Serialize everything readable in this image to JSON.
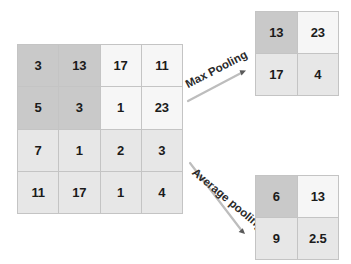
{
  "diagram": {
    "input_matrix": {
      "name": "input-feature-map",
      "rows": 4,
      "cols": 4,
      "cells": [
        {
          "value": "3",
          "tone": "tone-dark"
        },
        {
          "value": "13",
          "tone": "tone-dark"
        },
        {
          "value": "17",
          "tone": "tone-light"
        },
        {
          "value": "11",
          "tone": "tone-light"
        },
        {
          "value": "5",
          "tone": "tone-dark"
        },
        {
          "value": "3",
          "tone": "tone-dark"
        },
        {
          "value": "1",
          "tone": "tone-light"
        },
        {
          "value": "23",
          "tone": "tone-light"
        },
        {
          "value": "7",
          "tone": "tone-mid"
        },
        {
          "value": "1",
          "tone": "tone-mid"
        },
        {
          "value": "2",
          "tone": "tone-mid"
        },
        {
          "value": "3",
          "tone": "tone-mid"
        },
        {
          "value": "11",
          "tone": "tone-mid"
        },
        {
          "value": "17",
          "tone": "tone-mid"
        },
        {
          "value": "1",
          "tone": "tone-mid"
        },
        {
          "value": "4",
          "tone": "tone-mid"
        }
      ]
    },
    "max_pool": {
      "label": "Max Pooling",
      "matrix": {
        "name": "max-pool-output",
        "rows": 2,
        "cols": 2,
        "cells": [
          {
            "value": "13",
            "tone": "tone-dark"
          },
          {
            "value": "23",
            "tone": "tone-light"
          },
          {
            "value": "17",
            "tone": "tone-mid"
          },
          {
            "value": "4",
            "tone": "tone-mid"
          }
        ]
      }
    },
    "average_pool": {
      "label": "Average pooling",
      "matrix": {
        "name": "average-pool-output",
        "rows": 2,
        "cols": 2,
        "cells": [
          {
            "value": "6",
            "tone": "tone-dark"
          },
          {
            "value": "13",
            "tone": "tone-light"
          },
          {
            "value": "9",
            "tone": "tone-mid"
          },
          {
            "value": "2.5",
            "tone": "tone-mid"
          }
        ]
      }
    },
    "colors": {
      "highlight_dark": "#c9c9c9",
      "fill_mid": "#e7e7e7",
      "fill_light": "#f6f6f6",
      "grid_line": "#c4c4c4",
      "text": "#1b1b1b",
      "arrow": "#b9b9b9"
    }
  }
}
